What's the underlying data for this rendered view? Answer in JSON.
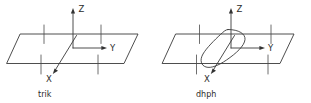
{
  "figure": {
    "background_color": "#ffffff",
    "line_color": "#3a3a3a",
    "text_color": "#2b2b2b",
    "panels": [
      {
        "id": "trik",
        "caption": "trik",
        "axes": [
          {
            "name": "Z",
            "label": "Z",
            "direction": "up"
          },
          {
            "name": "Y",
            "label": "Y",
            "direction": "right"
          },
          {
            "name": "X",
            "label": "X",
            "direction": "down-left"
          }
        ],
        "plane": "parallelogram",
        "tick_marks": 4,
        "center_shape": "none"
      },
      {
        "id": "dhph",
        "caption": "dhph",
        "axes": [
          {
            "name": "Z",
            "label": "Z",
            "direction": "up"
          },
          {
            "name": "Y",
            "label": "Y",
            "direction": "right"
          },
          {
            "name": "X",
            "label": "X",
            "direction": "down-left"
          }
        ],
        "plane": "parallelogram",
        "tick_marks": 4,
        "center_shape": "tilted-lens"
      }
    ]
  }
}
